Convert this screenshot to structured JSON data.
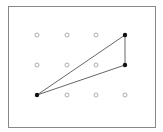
{
  "diagram": {
    "type": "geoboard-triangle",
    "frame": {
      "x": 8,
      "y": 6,
      "width": 147,
      "height": 121,
      "stroke": "#888888"
    },
    "grid": {
      "columns_x": [
        37,
        67,
        96,
        125
      ],
      "rows_y": [
        35,
        65,
        95
      ],
      "empty_dot_color": "#999999"
    },
    "filled_points": [
      {
        "col": 3,
        "row": 0,
        "x": 125,
        "y": 35
      },
      {
        "col": 3,
        "row": 1,
        "x": 125,
        "y": 65
      },
      {
        "col": 0,
        "row": 2,
        "x": 37,
        "y": 95
      }
    ],
    "triangle_edges": [
      {
        "from": [
          37,
          95
        ],
        "to": [
          125,
          35
        ]
      },
      {
        "from": [
          37,
          95
        ],
        "to": [
          125,
          65
        ]
      },
      {
        "from": [
          125,
          35
        ],
        "to": [
          125,
          65
        ]
      }
    ],
    "line_color": "#555555",
    "filled_color": "#111111"
  }
}
